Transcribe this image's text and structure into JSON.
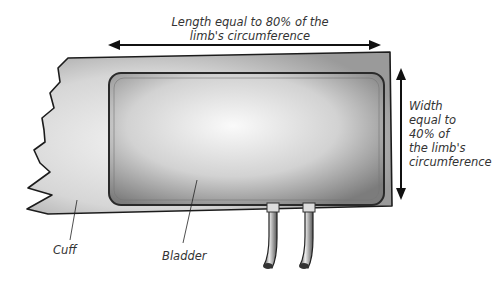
{
  "diagram": {
    "length_label": {
      "line1": "Length equal to 80% of the",
      "line2": "limb's circumference"
    },
    "width_label": {
      "line1": "Width",
      "line2": "equal to",
      "line3": "40% of",
      "line4": "the limb's",
      "line5": "circumference"
    },
    "parts": {
      "cuff": "Cuff",
      "bladder": "Bladder"
    },
    "colors": {
      "outline": "#222222",
      "cuff_fill": "#d9d9d9",
      "bladder_fill": "#c4c4c4",
      "text": "#333333"
    }
  }
}
